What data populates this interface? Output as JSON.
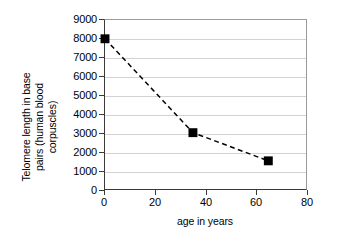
{
  "chart_data": {
    "type": "line",
    "title": "",
    "xlabel": "age in years",
    "ylabel": "Telomere length in base pairs (human blood corpuscles)",
    "ylabel_lines": [
      "Telomere length in base",
      "pairs (human blood",
      "corpuscles)"
    ],
    "x": [
      0,
      35,
      65
    ],
    "values": [
      8000,
      3000,
      1500
    ],
    "series": [
      {
        "name": "telomere length",
        "points": [
          {
            "x": 0,
            "y": 8000
          },
          {
            "x": 35,
            "y": 3000
          },
          {
            "x": 65,
            "y": 1500
          }
        ]
      }
    ],
    "xlim": [
      0,
      80
    ],
    "ylim": [
      0,
      9000
    ],
    "xticks": [
      0,
      20,
      40,
      60,
      80
    ],
    "yticks": [
      0,
      1000,
      2000,
      3000,
      4000,
      5000,
      6000,
      7000,
      8000,
      9000
    ],
    "xtick_labels": [
      "0",
      "20",
      "40",
      "60",
      "80"
    ],
    "ytick_labels": [
      "0",
      "1000",
      "2000",
      "3000",
      "4000",
      "5000",
      "6000",
      "7000",
      "8000",
      "9000"
    ],
    "grid": "horizontal",
    "legend": "none",
    "line_style": "dashed",
    "marker": "filled-square",
    "colors": {
      "line": "#000000",
      "marker": "#000000",
      "grid": "#d2d2d2",
      "axis": "#3a3a3a",
      "frame": "#9a9a9a",
      "background": "#ffffff"
    }
  }
}
